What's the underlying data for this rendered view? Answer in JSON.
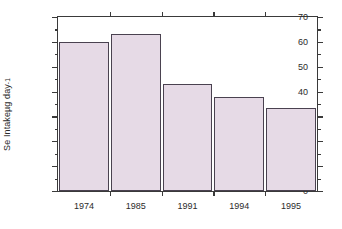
{
  "chart": {
    "ylabel_text": "Se Intake ",
    "ylabel_unit": "µg day",
    "ylabel_exp": "-1",
    "bar_fill": "#e6dae6",
    "bar_stroke": "#4a4250",
    "axis_color": "#3a3a3a"
  },
  "chart_data": {
    "type": "bar",
    "title": "",
    "xlabel": "",
    "ylabel": "Se Intake µg day⁻¹",
    "categories": [
      "1974",
      "1985",
      "1991",
      "1994",
      "1995"
    ],
    "values": [
      60,
      63,
      43,
      38,
      33.5
    ],
    "ylim": [
      0,
      70
    ],
    "xlim": [
      0,
      5
    ],
    "yticks": [
      0,
      10,
      20,
      30,
      40,
      50,
      60,
      70
    ],
    "ytick_labels": [
      "0",
      "10",
      "20",
      "30",
      "40",
      "50",
      "60",
      "70"
    ],
    "yminor_ticks": [
      5,
      15,
      25,
      35,
      45,
      55,
      65
    ],
    "grid": false,
    "legend": null,
    "legend_position": "none",
    "series": [
      {
        "name": "Se Intake",
        "values": [
          60,
          63,
          43,
          38,
          33.5
        ]
      }
    ],
    "annotations": []
  }
}
